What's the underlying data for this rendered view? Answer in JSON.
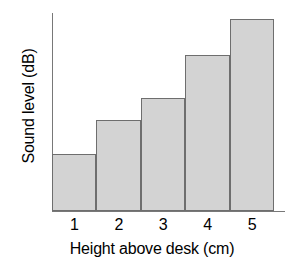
{
  "chart_data": {
    "type": "bar",
    "title": "",
    "subtitle": "",
    "xlabel": "Height above desk (cm)",
    "ylabel": "Sound level (dB)",
    "categories": [
      "1",
      "2",
      "3",
      "4",
      "5"
    ],
    "values": [
      28,
      45,
      56,
      78,
      96
    ],
    "value_unit": "relative bar height (%)",
    "ylim": [
      0,
      100
    ],
    "y_tick_labels": [],
    "x_tick_labels": [
      "1",
      "2",
      "3",
      "4",
      "5"
    ],
    "grid": false,
    "legend": null,
    "legend_position": "none",
    "annotations": [],
    "bar_fill_color": "#d3d3d3",
    "bar_border_color": "#6e6e6e",
    "axis_color": "#787878",
    "background_color": "#ffffff",
    "text_color": "#000000"
  },
  "axes": {
    "y_title": "Sound level (dB)",
    "x_title": "Height above desk (cm)"
  }
}
